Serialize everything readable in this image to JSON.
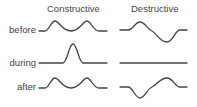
{
  "columns": [
    {
      "label": "Constructive"
    },
    {
      "label": "Destructive"
    }
  ],
  "rows": [
    {
      "label": "before"
    },
    {
      "label": "during"
    },
    {
      "label": "after"
    }
  ],
  "style": {
    "line_color": "#444444",
    "text_color": "#444444",
    "background": "#ffffff"
  }
}
